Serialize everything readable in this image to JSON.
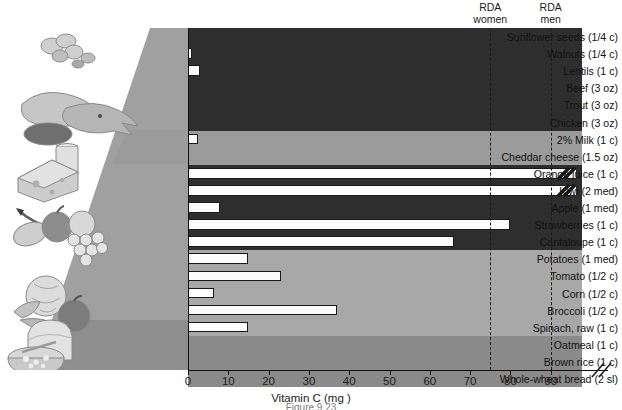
{
  "figure": {
    "axis_title": "Vitamin C (mg )",
    "caption": "Figure 9.23"
  },
  "axis": {
    "ticks": [
      0,
      10,
      20,
      30,
      40,
      50,
      60,
      70,
      80,
      90
    ],
    "min": 0,
    "max": 90,
    "break_symbol": "//"
  },
  "rda": [
    {
      "name": "rda-women",
      "line1": "RDA",
      "line2": "women",
      "value": 75
    },
    {
      "name": "rda-men",
      "line1": "RDA",
      "line2": "men",
      "value": 90
    }
  ],
  "groups": [
    {
      "name": "protein",
      "icon": "nuts-poultry-fish-icon",
      "shade": "#2e2e2e"
    },
    {
      "name": "dairy",
      "icon": "cheese-milk-icon",
      "shade": "#9b9b9b"
    },
    {
      "name": "fruits",
      "icon": "fruit-basket-icon",
      "shade": "#2e2e2e"
    },
    {
      "name": "vegetables",
      "icon": "vegetables-icon",
      "shade": "#a8a8a8"
    },
    {
      "name": "grains",
      "icon": "bread-oatmeal-icon",
      "shade": "#8a8a8a"
    }
  ],
  "chart_data": {
    "type": "bar",
    "orientation": "horizontal",
    "title": "",
    "xlabel": "Vitamin C (mg )",
    "ylabel": "",
    "xlim": [
      0,
      90
    ],
    "grid": false,
    "categories": [
      "Sunflower seeds (1/4 c)",
      "Walnuts (1/4 c)",
      "Lentils (1 c)",
      "Beef (3 oz)",
      "Trout (3 oz)",
      "Chicken (3 oz)",
      "2% Milk (1 c)",
      "Cheddar cheese (1.5 oz)",
      "Orange juice (1 c)",
      "Kiwi (2 med)",
      "Apple (1 med)",
      "Strawberries (1 c)",
      "Cantaloupe (1 c)",
      "Potatoes (1 med)",
      "Tomato (1/2 c)",
      "Corn (1/2 c)",
      "Broccoli (1/2 c)",
      "Spinach, raw (1 c)",
      "Oatmeal (1 c)",
      "Brown rice (1 c)",
      "Whole-wheat bread (2 sl)"
    ],
    "values": [
      0,
      1,
      3,
      0,
      0,
      0,
      2.4,
      0,
      97,
      95,
      8,
      80,
      66,
      15,
      23,
      6.5,
      37,
      15,
      0,
      0,
      0
    ],
    "group_of": [
      0,
      0,
      0,
      0,
      0,
      0,
      1,
      1,
      2,
      2,
      2,
      2,
      2,
      3,
      3,
      3,
      3,
      3,
      4,
      4,
      4
    ],
    "over_range": [
      false,
      false,
      false,
      false,
      false,
      false,
      false,
      false,
      true,
      true,
      false,
      false,
      false,
      false,
      false,
      false,
      false,
      false,
      false,
      false,
      false
    ],
    "bar_face": "#fcfcfc",
    "bar_edge": "#1a1a1a"
  }
}
